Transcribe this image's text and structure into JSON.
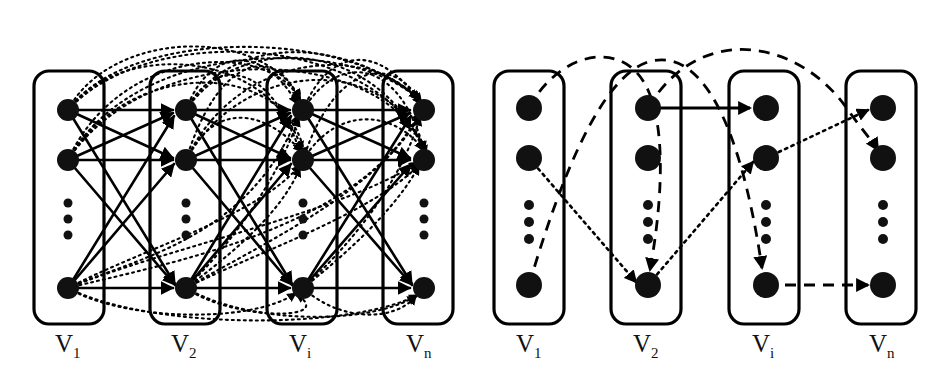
{
  "figure": {
    "type": "diagram",
    "title": "",
    "background_color": "#ffffff",
    "stroke_color": "#000000",
    "node_color": "#111111",
    "width": 942,
    "height": 377
  },
  "panels": [
    {
      "id": "left",
      "name": "fully-connected-layered-graph",
      "layers": [
        {
          "id": "L1",
          "label": "V",
          "subscript": "1",
          "label_full": "V1",
          "box": {
            "x": 34,
            "y": 71,
            "w": 70,
            "h": 253,
            "rx": 14
          },
          "label_pos": {
            "x": 69,
            "y": 348
          },
          "nodes": [
            {
              "id": "L1-n1",
              "cx": 68,
              "cy": 110,
              "r": 11
            },
            {
              "id": "L1-n2",
              "cx": 68,
              "cy": 160,
              "r": 11
            },
            {
              "id": "L1-n3",
              "cx": 68,
              "cy": 288,
              "r": 11
            }
          ],
          "ellipsis": [
            {
              "cx": 68,
              "cy": 203,
              "r": 4.5
            },
            {
              "cx": 68,
              "cy": 219,
              "r": 4.5
            },
            {
              "cx": 68,
              "cy": 235,
              "r": 4.5
            }
          ]
        },
        {
          "id": "L2",
          "label": "V",
          "subscript": "2",
          "label_full": "V2",
          "box": {
            "x": 150,
            "y": 71,
            "w": 70,
            "h": 253,
            "rx": 14
          },
          "label_pos": {
            "x": 185,
            "y": 348
          },
          "nodes": [
            {
              "id": "L2-n1",
              "cx": 186,
              "cy": 110,
              "r": 11
            },
            {
              "id": "L2-n2",
              "cx": 186,
              "cy": 160,
              "r": 11
            },
            {
              "id": "L2-n3",
              "cx": 186,
              "cy": 288,
              "r": 11
            }
          ],
          "ellipsis": [
            {
              "cx": 186,
              "cy": 203,
              "r": 4.5
            },
            {
              "cx": 186,
              "cy": 219,
              "r": 4.5
            },
            {
              "cx": 186,
              "cy": 235,
              "r": 4.5
            }
          ]
        },
        {
          "id": "Li",
          "label": "V",
          "subscript": "i",
          "label_full": "Vi",
          "box": {
            "x": 267,
            "y": 71,
            "w": 70,
            "h": 253,
            "rx": 14
          },
          "label_pos": {
            "x": 302,
            "y": 348
          },
          "nodes": [
            {
              "id": "Li-n1",
              "cx": 303,
              "cy": 110,
              "r": 11
            },
            {
              "id": "Li-n2",
              "cx": 303,
              "cy": 160,
              "r": 11
            },
            {
              "id": "Li-n3",
              "cx": 303,
              "cy": 288,
              "r": 11
            }
          ],
          "ellipsis": [
            {
              "cx": 303,
              "cy": 203,
              "r": 4.5
            },
            {
              "cx": 303,
              "cy": 219,
              "r": 4.5
            },
            {
              "cx": 303,
              "cy": 235,
              "r": 4.5
            }
          ]
        },
        {
          "id": "Ln",
          "label": "V",
          "subscript": "n",
          "label_full": "Vn",
          "box": {
            "x": 383,
            "y": 71,
            "w": 70,
            "h": 253,
            "rx": 14
          },
          "label_pos": {
            "x": 418,
            "y": 348
          },
          "nodes": [
            {
              "id": "Ln-n1",
              "cx": 424,
              "cy": 110,
              "r": 11
            },
            {
              "id": "Ln-n2",
              "cx": 424,
              "cy": 160,
              "r": 11
            },
            {
              "id": "Ln-n3",
              "cx": 424,
              "cy": 288,
              "r": 11
            }
          ],
          "ellipsis": [
            {
              "cx": 424,
              "cy": 203,
              "r": 4.5
            },
            {
              "cx": 424,
              "cy": 219,
              "r": 4.5
            },
            {
              "cx": 424,
              "cy": 235,
              "r": 4.5
            }
          ]
        }
      ],
      "edge_styles": {
        "solid": {
          "dash": "none",
          "width": 2.6
        },
        "dotted": {
          "dash": "2,4",
          "width": 2.2
        }
      }
    },
    {
      "id": "right",
      "name": "selected-paths-layered-graph",
      "layers": [
        {
          "id": "R1",
          "label": "V",
          "subscript": "1",
          "label_full": "V1",
          "box": {
            "x": 494,
            "y": 71,
            "w": 70,
            "h": 253,
            "rx": 14
          },
          "label_pos": {
            "x": 529,
            "y": 348
          },
          "nodes": [
            {
              "id": "R1-n1",
              "cx": 529,
              "cy": 108,
              "r": 13
            },
            {
              "id": "R1-n2",
              "cx": 529,
              "cy": 158,
              "r": 13
            },
            {
              "id": "R1-n3",
              "cx": 529,
              "cy": 285,
              "r": 13
            }
          ],
          "ellipsis": [
            {
              "cx": 529,
              "cy": 205,
              "r": 5
            },
            {
              "cx": 529,
              "cy": 222,
              "r": 5
            },
            {
              "cx": 529,
              "cy": 239,
              "r": 5
            }
          ]
        },
        {
          "id": "R2",
          "label": "V",
          "subscript": "2",
          "label_full": "V2",
          "box": {
            "x": 611,
            "y": 71,
            "w": 70,
            "h": 253,
            "rx": 14
          },
          "label_pos": {
            "x": 646,
            "y": 348
          },
          "nodes": [
            {
              "id": "R2-n1",
              "cx": 648,
              "cy": 108,
              "r": 13
            },
            {
              "id": "R2-n2",
              "cx": 648,
              "cy": 158,
              "r": 13
            },
            {
              "id": "R2-n3",
              "cx": 648,
              "cy": 285,
              "r": 13
            }
          ],
          "ellipsis": [
            {
              "cx": 648,
              "cy": 205,
              "r": 5
            },
            {
              "cx": 648,
              "cy": 222,
              "r": 5
            },
            {
              "cx": 648,
              "cy": 239,
              "r": 5
            }
          ]
        },
        {
          "id": "Ri",
          "label": "V",
          "subscript": "i",
          "label_full": "Vi",
          "box": {
            "x": 729,
            "y": 71,
            "w": 70,
            "h": 253,
            "rx": 14
          },
          "label_pos": {
            "x": 764,
            "y": 348
          },
          "nodes": [
            {
              "id": "Ri-n1",
              "cx": 766,
              "cy": 108,
              "r": 13
            },
            {
              "id": "Ri-n2",
              "cx": 766,
              "cy": 158,
              "r": 13
            },
            {
              "id": "Ri-n3",
              "cx": 766,
              "cy": 285,
              "r": 13
            }
          ],
          "ellipsis": [
            {
              "cx": 766,
              "cy": 205,
              "r": 5
            },
            {
              "cx": 766,
              "cy": 222,
              "r": 5
            },
            {
              "cx": 766,
              "cy": 239,
              "r": 5
            }
          ]
        },
        {
          "id": "Rn",
          "label": "V",
          "subscript": "n",
          "label_full": "Vn",
          "box": {
            "x": 846,
            "y": 71,
            "w": 70,
            "h": 253,
            "rx": 14
          },
          "label_pos": {
            "x": 881,
            "y": 348
          },
          "nodes": [
            {
              "id": "Rn-n1",
              "cx": 883,
              "cy": 108,
              "r": 13
            },
            {
              "id": "Rn-n2",
              "cx": 883,
              "cy": 158,
              "r": 13
            },
            {
              "id": "Rn-n3",
              "cx": 883,
              "cy": 285,
              "r": 13
            }
          ],
          "ellipsis": [
            {
              "cx": 883,
              "cy": 205,
              "r": 5
            },
            {
              "cx": 883,
              "cy": 222,
              "r": 5
            },
            {
              "cx": 883,
              "cy": 239,
              "r": 5
            }
          ]
        }
      ],
      "edge_styles": {
        "solid": {
          "dash": "none",
          "width": 2.8
        },
        "dashed": {
          "dash": "11,8",
          "width": 2.8
        },
        "dotted": {
          "dash": "2.5,4.5",
          "width": 2.6
        }
      },
      "paths": [
        {
          "id": "path-dashed-1",
          "style": "dashed",
          "from": "R1-n1",
          "to": "R2-n3",
          "note": "arcs over V1 and down into V2 bottom node"
        },
        {
          "id": "path-dashed-2",
          "style": "dashed",
          "from": "R1-n3",
          "to": "Ri-n3",
          "note": "arcs up over V2 and descends to Vi bottom node"
        },
        {
          "id": "path-dotted-1",
          "style": "dotted",
          "from": "R1-n2",
          "to": "R2-n3",
          "note": "descends to V2 bottom node"
        },
        {
          "id": "path-dotted-2",
          "style": "dotted",
          "from": "R2-n3",
          "to": "Ri-n2",
          "note": "ascends to Vi second node"
        },
        {
          "id": "path-dotted-3",
          "style": "dotted",
          "from": "Ri-n2",
          "to": "Rn-n1",
          "note": "to Vn top node"
        },
        {
          "id": "path-solid-1",
          "style": "solid",
          "from": "R2-n1",
          "to": "Ri-n1",
          "note": "horizontal V2 top to Vi top"
        },
        {
          "id": "path-dashed-3",
          "style": "dashed",
          "from": "R2-n1",
          "to": "Rn-n2",
          "note": "large arc over Vi down to Vn second node"
        },
        {
          "id": "path-dashed-4",
          "style": "dashed",
          "from": "Ri-n3",
          "to": "Rn-n3",
          "note": "horizontal Vi bottom to Vn bottom"
        }
      ]
    }
  ]
}
